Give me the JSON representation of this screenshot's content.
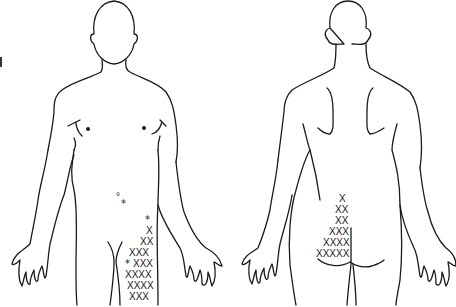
{
  "figure": {
    "type": "body-pain-diagram",
    "views": [
      {
        "id": "front",
        "label": "Anterior view"
      },
      {
        "id": "back",
        "label": "Posterior view"
      }
    ],
    "colors": {
      "line": "#1a1a1a",
      "background": "#ffffff"
    }
  },
  "markers": {
    "legend": {
      "cross": "X",
      "star": "*",
      "dot": "°"
    },
    "front": {
      "rows": [
        {
          "x": 118,
          "y": 200,
          "text": "°",
          "kind": "dot"
        },
        {
          "x": 125,
          "y": 206,
          "text": "*",
          "kind": "star"
        },
        {
          "x": 148,
          "y": 222,
          "text": "*",
          "kind": "star"
        },
        {
          "x": 149,
          "y": 233,
          "text": "X",
          "kind": "cross"
        },
        {
          "x": 142,
          "y": 244,
          "text": "XX",
          "kind": "cross"
        },
        {
          "x": 129,
          "y": 255,
          "text": "XXX",
          "kind": "cross"
        },
        {
          "x": 128,
          "y": 265,
          "text": "*",
          "kind": "star"
        },
        {
          "x": 136,
          "y": 266,
          "text": "XXX",
          "kind": "cross"
        },
        {
          "x": 126,
          "y": 277,
          "text": "XXXX",
          "kind": "cross"
        },
        {
          "x": 128,
          "y": 288,
          "text": "XXXX",
          "kind": "cross"
        },
        {
          "x": 130,
          "y": 299,
          "text": "XXX",
          "kind": "cross"
        }
      ]
    },
    "back": {
      "rows": [
        {
          "x": 341,
          "y": 201,
          "text": "X",
          "kind": "cross"
        },
        {
          "x": 336,
          "y": 212,
          "text": "XX",
          "kind": "cross"
        },
        {
          "x": 336,
          "y": 223,
          "text": "XX",
          "kind": "cross"
        },
        {
          "x": 330,
          "y": 233,
          "text": "XXX",
          "kind": "cross"
        },
        {
          "x": 323,
          "y": 244,
          "text": "XXXX",
          "kind": "cross"
        },
        {
          "x": 316,
          "y": 255,
          "text": "XXXXX",
          "kind": "cross"
        }
      ]
    }
  }
}
